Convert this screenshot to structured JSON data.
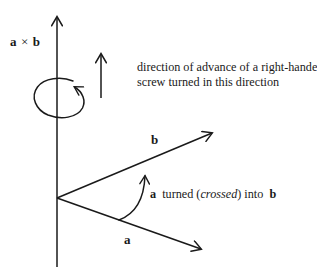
{
  "figure": {
    "background_color": "#ffffff",
    "stroke_color": "#1a1a1a",
    "labels": {
      "cross_product": "a × b",
      "cross_product_first": "a",
      "cross_product_operator": "×",
      "cross_product_second": "b",
      "vector_b": "b",
      "vector_a": "a"
    },
    "captions": {
      "screw": {
        "line1": "direction of advance of a right-handed",
        "line2": "screw turned in this direction"
      },
      "turn": {
        "part1": "a",
        "part2": "turned (",
        "part3": "crossed",
        "part4": ") into",
        "part5": "b"
      }
    },
    "icon_names": {
      "axis_arrow": "up-arrow-icon",
      "rotation_arrow": "circular-rotation-arrow-icon",
      "advance_arrow": "up-arrow-icon",
      "vector_b_arrow": "vector-arrow-icon",
      "vector_a_arrow": "vector-arrow-icon",
      "turn_arc_arrow": "curved-arrow-icon"
    }
  }
}
